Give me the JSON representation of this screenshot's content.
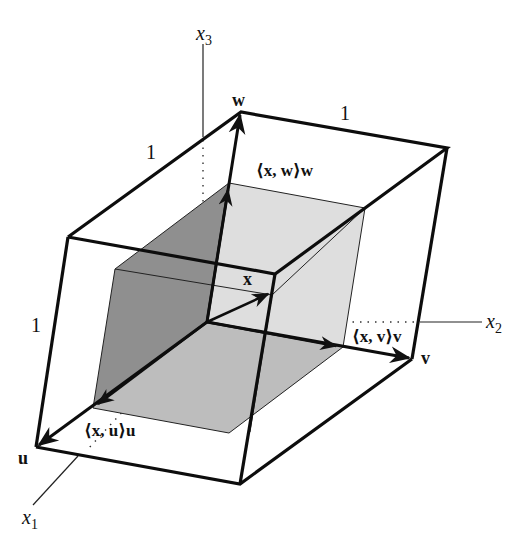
{
  "diagram": {
    "axes": {
      "x1": {
        "label": "x",
        "sub": "1"
      },
      "x2": {
        "label": "x",
        "sub": "2"
      },
      "x3": {
        "label": "x",
        "sub": "3"
      }
    },
    "vectors": {
      "u": "u",
      "v": "v",
      "w": "w",
      "x": "x"
    },
    "projections": {
      "u": "⟨x, u⟩u",
      "v": "⟨x, v⟩v",
      "w": "⟨x, w⟩w"
    },
    "edge_lengths": {
      "top": "1",
      "left_top": "1",
      "left_side": "1"
    },
    "colors": {
      "stroke": "#111111",
      "shade_dark": "#8c8c8c",
      "shade_mid": "#b9b9b9",
      "shade_light": "#dcdcdc",
      "background": "#ffffff"
    }
  }
}
